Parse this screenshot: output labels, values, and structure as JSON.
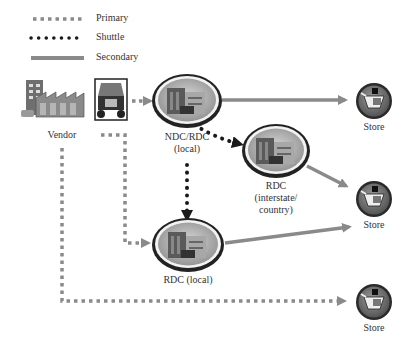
{
  "legend": {
    "items": [
      {
        "label": "Primary",
        "style": "square-dotted",
        "color": "#8a8a8a"
      },
      {
        "label": "Shuttle",
        "style": "round-dotted",
        "color": "#1a1a1a"
      },
      {
        "label": "Secondary",
        "style": "solid",
        "color": "#8a8a8a"
      }
    ]
  },
  "nodes": {
    "vendor": {
      "label": "Vendor",
      "icon": "factory-truck-icon"
    },
    "ndc": {
      "label_line1": "NDC/RDC",
      "label_line2": "(local)",
      "icon": "warehouse-building-icon"
    },
    "rdc_interstate": {
      "label_line1": "RDC",
      "label_line2": "(interstate/",
      "label_line3": "country)",
      "icon": "warehouse-building-icon"
    },
    "rdc_local": {
      "label": "RDC (local)",
      "icon": "warehouse-building-icon"
    },
    "store1": {
      "label": "Store",
      "icon": "shopping-cart-icon"
    },
    "store2": {
      "label": "Store",
      "icon": "shopping-cart-icon"
    },
    "store3": {
      "label": "Store",
      "icon": "shopping-cart-icon"
    }
  },
  "colors": {
    "primary": "#8a8a8a",
    "shuttle": "#1a1a1a",
    "secondary": "#8a8a8a",
    "store_ring": "#3a3a3a",
    "store_fill": "#7a7a7a"
  }
}
